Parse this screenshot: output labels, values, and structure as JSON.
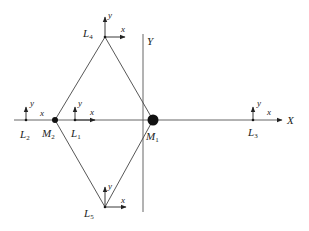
{
  "diagram": {
    "axes": {
      "x_label": "X",
      "y_label": "Y"
    },
    "masses": [
      {
        "id": "M1",
        "name": "M",
        "sub": "1",
        "size": "large"
      },
      {
        "id": "M2",
        "name": "M",
        "sub": "2",
        "size": "small"
      }
    ],
    "points": [
      {
        "id": "L1",
        "name": "L",
        "sub": "1"
      },
      {
        "id": "L2",
        "name": "L",
        "sub": "2"
      },
      {
        "id": "L3",
        "name": "L",
        "sub": "3"
      },
      {
        "id": "L4",
        "name": "L",
        "sub": "4"
      },
      {
        "id": "L5",
        "name": "L",
        "sub": "5"
      }
    ],
    "frame_labels": {
      "x": "x",
      "y": "y"
    },
    "edges": [
      [
        "L4",
        "M2"
      ],
      [
        "L4",
        "M1"
      ],
      [
        "L5",
        "M2"
      ],
      [
        "L5",
        "M1"
      ]
    ],
    "colors": {
      "ink": "#222222",
      "background": "#ffffff"
    }
  }
}
